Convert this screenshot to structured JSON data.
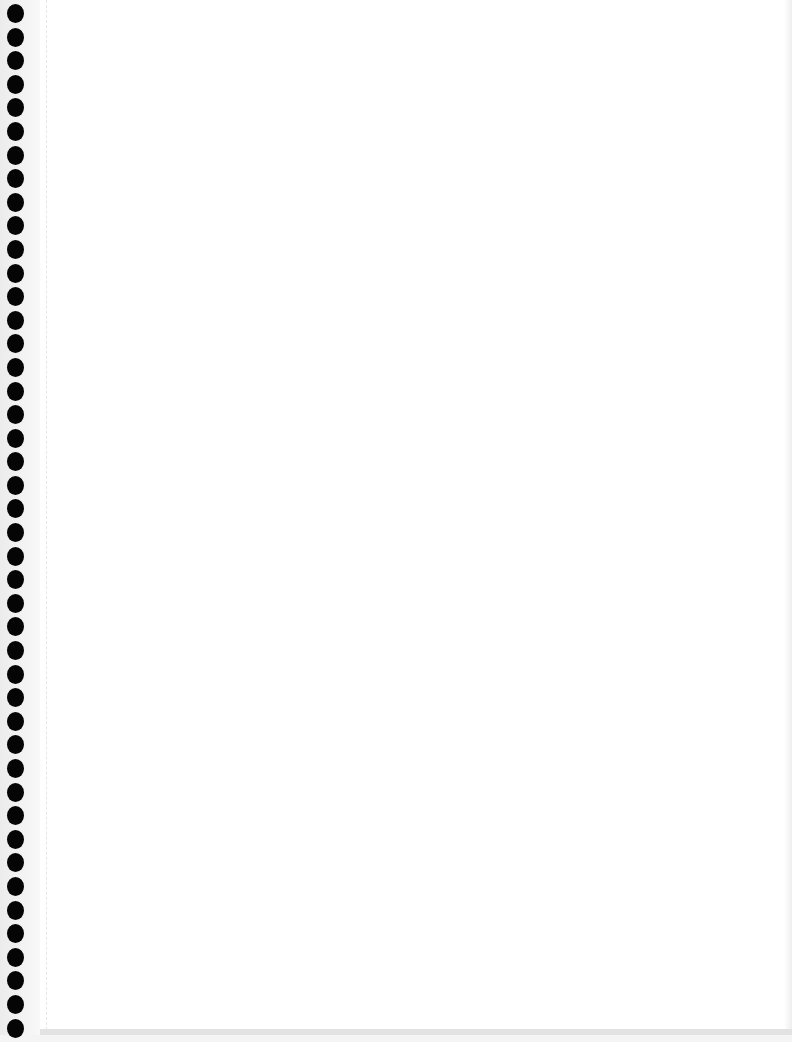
{
  "page": {
    "type": "blank spiral notebook page",
    "hole_count": 44,
    "colors": {
      "paper": "#ffffff",
      "holes": "#050505",
      "edge": "#ececec"
    }
  }
}
